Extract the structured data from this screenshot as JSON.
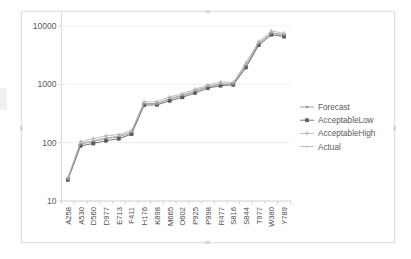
{
  "chart_data": {
    "type": "line",
    "title": "",
    "xlabel": "",
    "ylabel": "",
    "yscale": "log",
    "ylim": [
      10,
      10000
    ],
    "ytick_labels": [
      "10",
      "100",
      "1000",
      "10000"
    ],
    "ytick_values": [
      10,
      100,
      1000,
      10000
    ],
    "grid": true,
    "legend_position": "right",
    "categories": [
      "A258",
      "A530",
      "D560",
      "D977",
      "E713",
      "F411",
      "H176",
      "K898",
      "M665",
      "O602",
      "P925",
      "P998",
      "R477",
      "S816",
      "S844",
      "T977",
      "W380",
      "Y789"
    ],
    "series": [
      {
        "name": "Forecast",
        "marker": "dot",
        "color": "#8c8c8c",
        "values": [
          24,
          95,
          105,
          118,
          126,
          148,
          465,
          470,
          560,
          640,
          760,
          910,
          1000,
          1020,
          2050,
          5000,
          7600,
          7000
        ]
      },
      {
        "name": "AcceptableLow",
        "marker": "square",
        "color": "#5a5a5a",
        "values": [
          23,
          88,
          97,
          108,
          117,
          140,
          440,
          445,
          520,
          600,
          710,
          860,
          950,
          980,
          1950,
          4700,
          7100,
          6600
        ]
      },
      {
        "name": "AcceptableHigh",
        "marker": "plus",
        "color": "#b0b0b0",
        "values": [
          25,
          104,
          117,
          131,
          138,
          160,
          500,
          505,
          610,
          690,
          820,
          980,
          1090,
          1080,
          2200,
          5400,
          8200,
          7500
        ]
      },
      {
        "name": "Actual",
        "marker": "line",
        "color": "#a8a8a8",
        "values": [
          24,
          97,
          108,
          120,
          129,
          152,
          470,
          462,
          575,
          650,
          775,
          925,
          1010,
          1015,
          2400,
          5100,
          7500,
          7050
        ]
      }
    ]
  },
  "legend": {
    "items": [
      {
        "label": "Forecast"
      },
      {
        "label": "AcceptableLow"
      },
      {
        "label": "AcceptableHigh"
      },
      {
        "label": "Actual"
      }
    ]
  }
}
